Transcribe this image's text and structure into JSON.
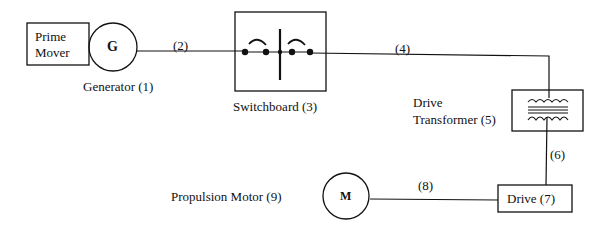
{
  "diagram": {
    "type": "electric propulsion single-line diagram",
    "components": [
      {
        "id": "prime_mover",
        "label_line1": "Prime",
        "label_line2": "Mover"
      },
      {
        "id": "generator",
        "symbol": "G",
        "label": "Generator (1)"
      },
      {
        "id": "switchboard",
        "label": "Switchboard (3)"
      },
      {
        "id": "drive_transformer",
        "label_line1": "Drive",
        "label_line2": "Transformer  (5)"
      },
      {
        "id": "drive",
        "label": "Drive (7)"
      },
      {
        "id": "propulsion_motor",
        "symbol": "M",
        "label": "Propulsion Motor  (9)"
      }
    ],
    "connections": [
      {
        "label": "(2)",
        "from": "generator",
        "to": "switchboard"
      },
      {
        "label": "(4)",
        "from": "switchboard",
        "to": "drive_transformer"
      },
      {
        "label": "(6)",
        "from": "drive_transformer",
        "to": "drive"
      },
      {
        "label": "(8)",
        "from": "drive",
        "to": "propulsion_motor"
      }
    ]
  }
}
